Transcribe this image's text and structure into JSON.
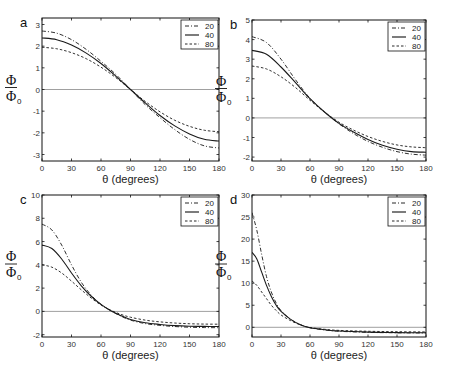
{
  "chart_data": [
    {
      "panel": "a",
      "type": "line",
      "title": "",
      "xlabel": "θ (degrees)",
      "ylabel": "Φ/Φ0",
      "xlim": [
        0,
        180
      ],
      "ylim": [
        -3.3,
        3.3
      ],
      "xticks": [
        0,
        30,
        60,
        90,
        120,
        150,
        180
      ],
      "yticks": [
        -3,
        -2,
        -1,
        0,
        1,
        2,
        3
      ],
      "legend": [
        "20",
        "40",
        "80"
      ],
      "legend_position": "upper right",
      "frame": {
        "x0": 42,
        "x1": 219,
        "y0": 18,
        "y1": 161
      },
      "x": [
        0,
        15,
        30,
        45,
        60,
        75,
        90,
        105,
        120,
        135,
        150,
        165,
        180
      ],
      "series": [
        {
          "name": "20",
          "style": "dashdot",
          "values": [
            2.7,
            2.6,
            2.3,
            1.85,
            1.3,
            0.7,
            0.0,
            -0.7,
            -1.3,
            -1.85,
            -2.3,
            -2.6,
            -2.7
          ]
        },
        {
          "name": "40",
          "style": "solid",
          "values": [
            2.38,
            2.3,
            2.05,
            1.68,
            1.2,
            0.62,
            0.0,
            -0.62,
            -1.2,
            -1.68,
            -2.05,
            -2.3,
            -2.38
          ]
        },
        {
          "name": "80",
          "style": "dashed",
          "values": [
            1.95,
            1.88,
            1.7,
            1.42,
            1.03,
            0.55,
            0.0,
            -0.55,
            -1.03,
            -1.42,
            -1.7,
            -1.88,
            -1.95
          ]
        }
      ]
    },
    {
      "panel": "b",
      "type": "line",
      "title": "",
      "xlabel": "θ (degrees)",
      "ylabel": "Φ/Φ0",
      "xlim": [
        0,
        180
      ],
      "ylim": [
        -2.2,
        5
      ],
      "xticks": [
        0,
        30,
        60,
        90,
        120,
        150,
        180
      ],
      "yticks": [
        -2,
        -1,
        0,
        1,
        2,
        3,
        4,
        5
      ],
      "legend": [
        "20",
        "40",
        "80"
      ],
      "legend_position": "upper right",
      "frame": {
        "x0": 252,
        "x1": 426,
        "y0": 20,
        "y1": 161
      },
      "x": [
        0,
        15,
        30,
        45,
        60,
        75,
        90,
        105,
        120,
        135,
        150,
        165,
        180
      ],
      "series": [
        {
          "name": "20",
          "style": "dashdot",
          "values": [
            4.15,
            3.85,
            3.0,
            1.95,
            1.0,
            0.3,
            -0.3,
            -0.8,
            -1.2,
            -1.5,
            -1.72,
            -1.85,
            -1.9
          ]
        },
        {
          "name": "40",
          "style": "solid",
          "values": [
            3.45,
            3.25,
            2.6,
            1.8,
            0.98,
            0.3,
            -0.28,
            -0.72,
            -1.1,
            -1.4,
            -1.6,
            -1.72,
            -1.75
          ]
        },
        {
          "name": "80",
          "style": "dashed",
          "values": [
            2.65,
            2.5,
            2.1,
            1.55,
            0.9,
            0.3,
            -0.22,
            -0.62,
            -0.95,
            -1.2,
            -1.38,
            -1.48,
            -1.52
          ]
        }
      ]
    },
    {
      "panel": "c",
      "type": "line",
      "title": "",
      "xlabel": "θ (degrees)",
      "ylabel": "Φ/Φ0",
      "xlim": [
        0,
        180
      ],
      "ylim": [
        -2.2,
        10
      ],
      "xticks": [
        0,
        30,
        60,
        90,
        120,
        150,
        180
      ],
      "yticks": [
        -2,
        0,
        2,
        4,
        6,
        8,
        10
      ],
      "legend": [
        "20",
        "40",
        "80"
      ],
      "legend_position": "upper right",
      "frame": {
        "x0": 42,
        "x1": 219,
        "y0": 195,
        "y1": 337
      },
      "x": [
        0,
        10,
        20,
        30,
        40,
        50,
        60,
        70,
        80,
        90,
        105,
        120,
        135,
        150,
        165,
        180
      ],
      "series": [
        {
          "name": "20",
          "style": "dashdot",
          "values": [
            7.5,
            7.0,
            5.7,
            4.0,
            2.5,
            1.4,
            0.6,
            0.05,
            -0.4,
            -0.75,
            -1.05,
            -1.2,
            -1.3,
            -1.36,
            -1.39,
            -1.4
          ]
        },
        {
          "name": "40",
          "style": "solid",
          "values": [
            5.7,
            5.4,
            4.5,
            3.3,
            2.2,
            1.3,
            0.6,
            0.05,
            -0.35,
            -0.7,
            -0.98,
            -1.12,
            -1.22,
            -1.27,
            -1.29,
            -1.3
          ]
        },
        {
          "name": "80",
          "style": "dashed",
          "values": [
            4.0,
            3.8,
            3.3,
            2.6,
            1.85,
            1.15,
            0.55,
            0.1,
            -0.25,
            -0.5,
            -0.75,
            -0.9,
            -1.0,
            -1.06,
            -1.09,
            -1.1
          ]
        }
      ]
    },
    {
      "panel": "d",
      "type": "line",
      "title": "",
      "xlabel": "θ (degrees)",
      "ylabel": "Φ/Φ0",
      "xlim": [
        0,
        180
      ],
      "ylim": [
        -2.2,
        30
      ],
      "xticks": [
        0,
        30,
        60,
        90,
        120,
        150,
        180
      ],
      "yticks": [
        0,
        5,
        10,
        15,
        20,
        25,
        30
      ],
      "legend": [
        "20",
        "40",
        "80"
      ],
      "legend_position": "upper right",
      "frame": {
        "x0": 252,
        "x1": 426,
        "y0": 195,
        "y1": 337
      },
      "x": [
        0,
        5,
        10,
        15,
        20,
        25,
        30,
        40,
        50,
        60,
        75,
        90,
        120,
        150,
        180
      ],
      "series": [
        {
          "name": "20",
          "style": "dashdot",
          "values": [
            26.0,
            22.0,
            16.5,
            11.5,
            8.0,
            5.5,
            3.8,
            1.8,
            0.6,
            -0.1,
            -0.6,
            -0.9,
            -1.15,
            -1.25,
            -1.3
          ]
        },
        {
          "name": "40",
          "style": "solid",
          "values": [
            17.0,
            15.5,
            12.5,
            9.5,
            7.0,
            5.0,
            3.6,
            1.8,
            0.6,
            -0.1,
            -0.55,
            -0.85,
            -1.1,
            -1.2,
            -1.25
          ]
        },
        {
          "name": "80",
          "style": "dashed",
          "values": [
            10.5,
            9.5,
            8.0,
            6.5,
            5.0,
            3.8,
            2.8,
            1.5,
            0.55,
            -0.05,
            -0.45,
            -0.7,
            -0.9,
            -1.0,
            -1.05
          ]
        }
      ]
    }
  ],
  "labels": {
    "panel_letters": [
      "a",
      "b",
      "c",
      "d"
    ],
    "ylabel_numerator": "Φ",
    "ylabel_denominator": "Φ",
    "ylabel_subscript": "0",
    "xlabel": "θ (degrees)"
  }
}
